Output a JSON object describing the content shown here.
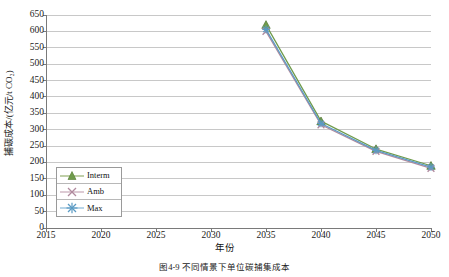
{
  "chart_data": {
    "type": "line",
    "title": "",
    "xlabel": "年份",
    "ylabel": "捕碳成本/(亿元/t CO₂)",
    "x": [
      2035,
      2040,
      2045,
      2050
    ],
    "xlim": [
      2015,
      2050
    ],
    "ylim": [
      0,
      650
    ],
    "xticks": [
      "2015",
      "2020",
      "2025",
      "2030",
      "2035",
      "2040",
      "2045",
      "2050"
    ],
    "yticks": [
      "0",
      "50",
      "100",
      "150",
      "200",
      "250",
      "300",
      "350",
      "400",
      "450",
      "500",
      "550",
      "600",
      "650"
    ],
    "grid": "horizontal",
    "legend_position": "inside-left-lower",
    "series": [
      {
        "name": "Interm",
        "values": [
          620,
          326,
          241,
          190
        ],
        "color": "#6f9b4b",
        "marker": "triangle"
      },
      {
        "name": "Amb",
        "values": [
          600,
          315,
          234,
          182
        ],
        "color": "#b08a9e",
        "marker": "x"
      },
      {
        "name": "Max",
        "values": [
          606,
          319,
          237,
          186
        ],
        "color": "#5b9bc4",
        "marker": "asterisk"
      }
    ]
  },
  "caption": {
    "text": "图4-9  不同情景下单位碳捕集成本"
  },
  "axes": {
    "y_title": "捕碳成本/(亿元/t CO₂)",
    "x_title": "年份"
  },
  "legend": {
    "items": [
      {
        "label": "Interm"
      },
      {
        "label": "Amb"
      },
      {
        "label": "Max"
      }
    ]
  }
}
